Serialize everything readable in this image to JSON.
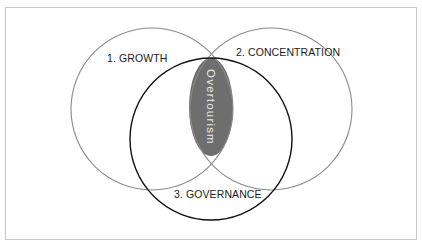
{
  "diagram": {
    "type": "venn",
    "sets": [
      {
        "id": "growth",
        "label": "1. GROWTH",
        "stroke": "#8a8a8a"
      },
      {
        "id": "concentration",
        "label": "2. CONCENTRATION",
        "stroke": "#8a8a8a"
      },
      {
        "id": "governance",
        "label": "3. GOVERNANCE",
        "stroke": "#111111"
      }
    ],
    "intersection": {
      "label": "Overtourism",
      "fill": "#6e6e6e",
      "text_color": "#e6e6e6"
    }
  }
}
